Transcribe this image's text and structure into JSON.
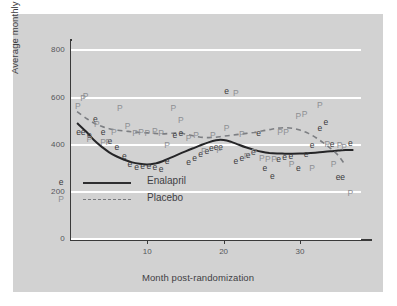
{
  "chart_data": {
    "type": "scatter",
    "title": "",
    "xlabel": "Month post-randomization",
    "ylabel": "Average monthly cost ($US)",
    "xlim": [
      0,
      38
    ],
    "ylim": [
      0,
      840
    ],
    "yticks": [
      0,
      200,
      400,
      600,
      800
    ],
    "ytick_labels": [
      "0",
      "200",
      "400",
      "600",
      "800"
    ],
    "xticks": [
      10,
      20,
      30
    ],
    "xtick_labels": [
      "10",
      "20",
      "30"
    ],
    "grid": "horizontal-white",
    "legend": {
      "position": "inside-lower-left",
      "entries": [
        {
          "marker": "e",
          "line": "solid",
          "label": "Enalapril"
        },
        {
          "marker": "P",
          "line": "dashed",
          "label": "Placebo"
        }
      ]
    },
    "series": [
      {
        "name": "Enalapril",
        "marker": "e",
        "color": "#39393b",
        "line_style": "solid",
        "points": [
          {
            "x": 1,
            "y": 455
          },
          {
            "x": 1.6,
            "y": 452
          },
          {
            "x": 2.4,
            "y": 440
          },
          {
            "x": 3.2,
            "y": 510
          },
          {
            "x": 4.2,
            "y": 452
          },
          {
            "x": 5.1,
            "y": 415
          },
          {
            "x": 6.0,
            "y": 390
          },
          {
            "x": 7.0,
            "y": 352
          },
          {
            "x": 7.7,
            "y": 320
          },
          {
            "x": 8.6,
            "y": 305
          },
          {
            "x": 9.4,
            "y": 310
          },
          {
            "x": 10.2,
            "y": 308
          },
          {
            "x": 11.0,
            "y": 305
          },
          {
            "x": 11.8,
            "y": 298
          },
          {
            "x": 12.6,
            "y": 330
          },
          {
            "x": 13.6,
            "y": 440
          },
          {
            "x": 14.4,
            "y": 448
          },
          {
            "x": 15.4,
            "y": 325
          },
          {
            "x": 16.2,
            "y": 345
          },
          {
            "x": 17.0,
            "y": 360
          },
          {
            "x": 17.8,
            "y": 375
          },
          {
            "x": 18.4,
            "y": 385
          },
          {
            "x": 19.0,
            "y": 390
          },
          {
            "x": 19.6,
            "y": 392
          },
          {
            "x": 20.4,
            "y": 630
          },
          {
            "x": 21.6,
            "y": 330
          },
          {
            "x": 22.4,
            "y": 345
          },
          {
            "x": 23.2,
            "y": 358
          },
          {
            "x": 23.9,
            "y": 370
          },
          {
            "x": 24.6,
            "y": 448
          },
          {
            "x": 25.4,
            "y": 300
          },
          {
            "x": 26.4,
            "y": 268
          },
          {
            "x": 27.2,
            "y": 340
          },
          {
            "x": 28.0,
            "y": 348
          },
          {
            "x": 28.8,
            "y": 352
          },
          {
            "x": 29.8,
            "y": 300
          },
          {
            "x": 30.8,
            "y": 360
          },
          {
            "x": 31.6,
            "y": 400
          },
          {
            "x": 32.6,
            "y": 470
          },
          {
            "x": 33.4,
            "y": 495
          },
          {
            "x": 34.2,
            "y": 405
          },
          {
            "x": 35.0,
            "y": 262
          },
          {
            "x": 35.6,
            "y": 265
          },
          {
            "x": 36.6,
            "y": 408
          }
        ],
        "smooth_curve": [
          {
            "x": 0.8,
            "y": 492
          },
          {
            "x": 2,
            "y": 455
          },
          {
            "x": 3,
            "y": 420
          },
          {
            "x": 4,
            "y": 392
          },
          {
            "x": 5,
            "y": 368
          },
          {
            "x": 6,
            "y": 350
          },
          {
            "x": 7,
            "y": 336
          },
          {
            "x": 8,
            "y": 325
          },
          {
            "x": 9,
            "y": 319
          },
          {
            "x": 10,
            "y": 316
          },
          {
            "x": 11,
            "y": 320
          },
          {
            "x": 12,
            "y": 330
          },
          {
            "x": 13,
            "y": 344
          },
          {
            "x": 14,
            "y": 358
          },
          {
            "x": 15,
            "y": 372
          },
          {
            "x": 16,
            "y": 385
          },
          {
            "x": 17,
            "y": 398
          },
          {
            "x": 18,
            "y": 410
          },
          {
            "x": 19,
            "y": 419
          },
          {
            "x": 20,
            "y": 420
          },
          {
            "x": 21,
            "y": 412
          },
          {
            "x": 22,
            "y": 400
          },
          {
            "x": 23,
            "y": 388
          },
          {
            "x": 24,
            "y": 378
          },
          {
            "x": 25,
            "y": 370
          },
          {
            "x": 26,
            "y": 365
          },
          {
            "x": 27,
            "y": 363
          },
          {
            "x": 28,
            "y": 362
          },
          {
            "x": 29,
            "y": 362
          },
          {
            "x": 30,
            "y": 363
          },
          {
            "x": 31,
            "y": 364
          },
          {
            "x": 32,
            "y": 366
          },
          {
            "x": 33,
            "y": 369
          },
          {
            "x": 34,
            "y": 372
          },
          {
            "x": 35,
            "y": 375
          },
          {
            "x": 36,
            "y": 377
          },
          {
            "x": 37,
            "y": 378
          }
        ]
      },
      {
        "name": "Placebo",
        "marker": "P",
        "color": "#8d8f93",
        "line_style": "dashed",
        "points": [
          {
            "x": 0.9,
            "y": 565
          },
          {
            "x": 1.6,
            "y": 600
          },
          {
            "x": 1.9,
            "y": 605
          },
          {
            "x": 2.4,
            "y": 425
          },
          {
            "x": 3.4,
            "y": 490
          },
          {
            "x": 4.2,
            "y": 410
          },
          {
            "x": 4.9,
            "y": 410
          },
          {
            "x": 5.6,
            "y": 455
          },
          {
            "x": 6.4,
            "y": 555
          },
          {
            "x": 7.4,
            "y": 480
          },
          {
            "x": 8.4,
            "y": 450
          },
          {
            "x": 9.2,
            "y": 452
          },
          {
            "x": 10.0,
            "y": 450
          },
          {
            "x": 11.0,
            "y": 458
          },
          {
            "x": 11.8,
            "y": 450
          },
          {
            "x": 12.6,
            "y": 400
          },
          {
            "x": 13.4,
            "y": 555
          },
          {
            "x": 14.4,
            "y": 505
          },
          {
            "x": 15.4,
            "y": 430
          },
          {
            "x": 16.4,
            "y": 440
          },
          {
            "x": 17.4,
            "y": 375
          },
          {
            "x": 18.6,
            "y": 440
          },
          {
            "x": 19.4,
            "y": 378
          },
          {
            "x": 20.4,
            "y": 470
          },
          {
            "x": 21.6,
            "y": 620
          },
          {
            "x": 22.4,
            "y": 445
          },
          {
            "x": 23.0,
            "y": 352
          },
          {
            "x": 24.0,
            "y": 370
          },
          {
            "x": 25.0,
            "y": 345
          },
          {
            "x": 25.8,
            "y": 340
          },
          {
            "x": 26.6,
            "y": 340
          },
          {
            "x": 27.4,
            "y": 452
          },
          {
            "x": 28.2,
            "y": 455
          },
          {
            "x": 28.9,
            "y": 320
          },
          {
            "x": 29.8,
            "y": 520
          },
          {
            "x": 30.6,
            "y": 530
          },
          {
            "x": 31.6,
            "y": 300
          },
          {
            "x": 32.6,
            "y": 570
          },
          {
            "x": 33.6,
            "y": 405
          },
          {
            "x": 34.4,
            "y": 320
          },
          {
            "x": 35.2,
            "y": 400
          },
          {
            "x": 35.8,
            "y": 390
          },
          {
            "x": 36.6,
            "y": 195
          }
        ],
        "smooth_curve": [
          {
            "x": 0.8,
            "y": 540
          },
          {
            "x": 2,
            "y": 512
          },
          {
            "x": 3,
            "y": 492
          },
          {
            "x": 4,
            "y": 478
          },
          {
            "x": 5,
            "y": 468
          },
          {
            "x": 6,
            "y": 462
          },
          {
            "x": 7,
            "y": 458
          },
          {
            "x": 8,
            "y": 455
          },
          {
            "x": 9,
            "y": 452
          },
          {
            "x": 10,
            "y": 450
          },
          {
            "x": 11,
            "y": 448
          },
          {
            "x": 12,
            "y": 446
          },
          {
            "x": 13,
            "y": 448
          },
          {
            "x": 14,
            "y": 450
          },
          {
            "x": 15,
            "y": 445
          },
          {
            "x": 16,
            "y": 438
          },
          {
            "x": 17,
            "y": 432
          },
          {
            "x": 18,
            "y": 430
          },
          {
            "x": 19,
            "y": 432
          },
          {
            "x": 20,
            "y": 436
          },
          {
            "x": 21,
            "y": 440
          },
          {
            "x": 22,
            "y": 444
          },
          {
            "x": 23,
            "y": 448
          },
          {
            "x": 24,
            "y": 452
          },
          {
            "x": 25,
            "y": 458
          },
          {
            "x": 26,
            "y": 464
          },
          {
            "x": 27,
            "y": 470
          },
          {
            "x": 28,
            "y": 472
          },
          {
            "x": 29,
            "y": 470
          },
          {
            "x": 30,
            "y": 462
          },
          {
            "x": 31,
            "y": 450
          },
          {
            "x": 32,
            "y": 432
          },
          {
            "x": 33,
            "y": 410
          },
          {
            "x": 34,
            "y": 385
          },
          {
            "x": 35,
            "y": 355
          },
          {
            "x": 35.8,
            "y": 320
          }
        ]
      }
    ]
  },
  "colors": {
    "figure_background": "#d2d2d2",
    "page_background": "#ffffff",
    "gridline": "#ffffff",
    "axis": "#3a3a3a",
    "enalapril": "#39393b",
    "placebo": "#8d8f93"
  }
}
